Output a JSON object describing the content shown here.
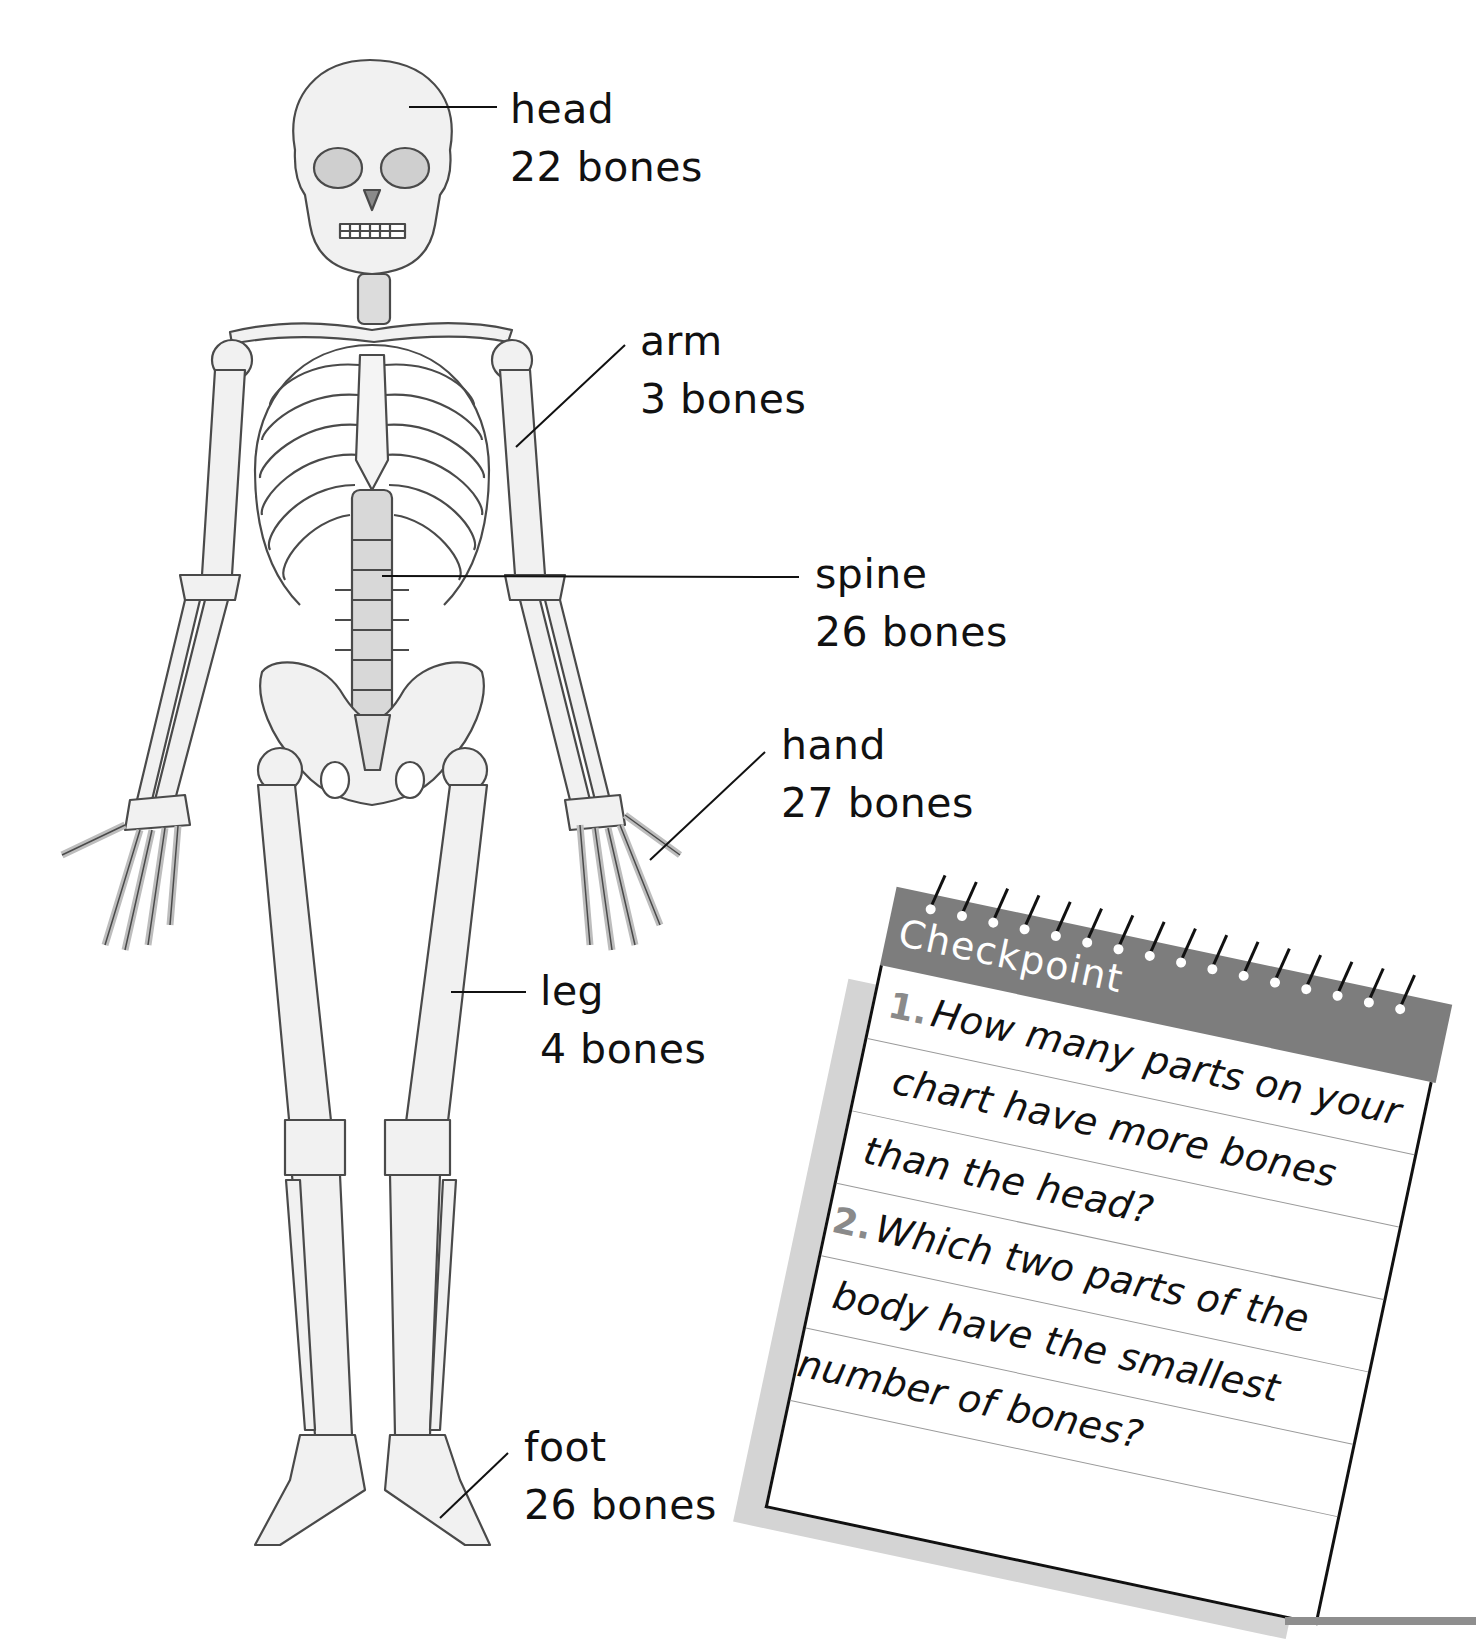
{
  "labels": {
    "head": {
      "part": "head",
      "count": "22 bones"
    },
    "arm": {
      "part": "arm",
      "count": "3 bones"
    },
    "spine": {
      "part": "spine",
      "count": "26 bones"
    },
    "hand": {
      "part": "hand",
      "count": "27 bones"
    },
    "leg": {
      "part": "leg",
      "count": "4 bones"
    },
    "foot": {
      "part": "foot",
      "count": "26 bones"
    }
  },
  "checkpoint": {
    "title": "Checkpoint",
    "questions": [
      {
        "number": "1.",
        "lines": [
          "How many parts on your",
          "chart have more bones",
          "than the head?"
        ]
      },
      {
        "number": "2.",
        "lines": [
          "Which two parts of the",
          "body have the smallest",
          "number of bones?"
        ]
      }
    ]
  },
  "colors": {
    "header_gray": "#7d7d7d",
    "shadow_gray": "#d4d4d4",
    "number_gray": "#8a8a8a",
    "ink": "#111111"
  }
}
